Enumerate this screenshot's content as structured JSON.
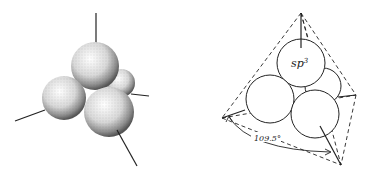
{
  "figure": {
    "left_panel": {
      "description": "stippled sp3 hybrid orbital spheres with bond axes",
      "spheres": 4
    },
    "right_panel": {
      "orbital_label_base": "sp",
      "orbital_label_sup": "3",
      "angle_label": "109.5°",
      "spheres": 4
    }
  },
  "colors": {
    "line": "#222222",
    "background": "#ffffff"
  }
}
